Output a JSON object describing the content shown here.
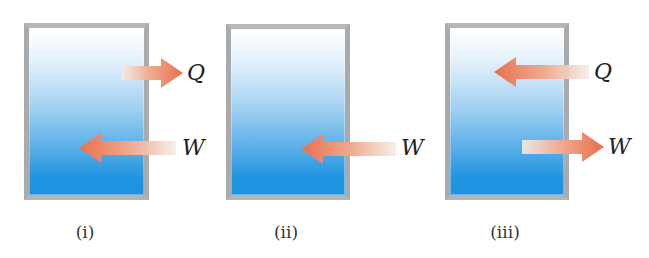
{
  "figure": {
    "panels": [
      {
        "id": "i",
        "caption": "(i)",
        "arrows": [
          {
            "label": "Q",
            "direction": "out",
            "meaning": "heat leaves system"
          },
          {
            "label": "W",
            "direction": "in",
            "meaning": "work done on system"
          }
        ]
      },
      {
        "id": "ii",
        "caption": "(ii)",
        "arrows": [
          {
            "label": "W",
            "direction": "in",
            "meaning": "work done on system"
          }
        ]
      },
      {
        "id": "iii",
        "caption": "(iii)",
        "arrows": [
          {
            "label": "Q",
            "direction": "in",
            "meaning": "heat enters system"
          },
          {
            "label": "W",
            "direction": "out",
            "meaning": "work done by system"
          }
        ]
      }
    ],
    "colors": {
      "frame": "#a9aaac",
      "fill_top": "#ffffff",
      "fill_bottom": "#1d92df",
      "arrow_head": "#e8714f",
      "arrow_tail": "#f5ede8",
      "text": "#222222"
    }
  }
}
